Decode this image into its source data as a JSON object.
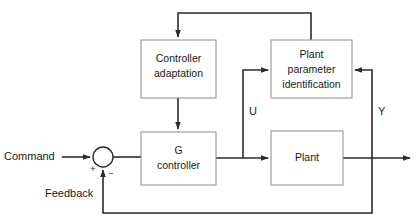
{
  "diagram": {
    "colors": {
      "background": "#ffffff",
      "box_border": "#8c8c8c",
      "box_fill": "#ffffff",
      "wire": "#2b2b2b",
      "text": "#1a1a1a"
    },
    "blocks": [
      {
        "id": "controller-adaptation",
        "line1": "Controller",
        "line2": "adaptation",
        "x": 141,
        "y": 40,
        "w": 75,
        "h": 58
      },
      {
        "id": "plant-parameter-identification",
        "line1": "Plant",
        "line2": "parameter",
        "line3": "identification",
        "x": 271,
        "y": 40,
        "w": 81,
        "h": 58
      },
      {
        "id": "g-controller",
        "line1": "G",
        "line2": "controller",
        "x": 141,
        "y": 132,
        "w": 75,
        "h": 53
      },
      {
        "id": "plant",
        "line1": "Plant",
        "x": 271,
        "y": 131,
        "w": 72,
        "h": 54
      }
    ],
    "signal_labels": {
      "command": "Command",
      "feedback": "Feedback",
      "u": "U",
      "y": "Y",
      "plus": "+",
      "minus": "−"
    },
    "summing_junction": {
      "cx": 103,
      "cy": 157,
      "r": 10
    }
  }
}
